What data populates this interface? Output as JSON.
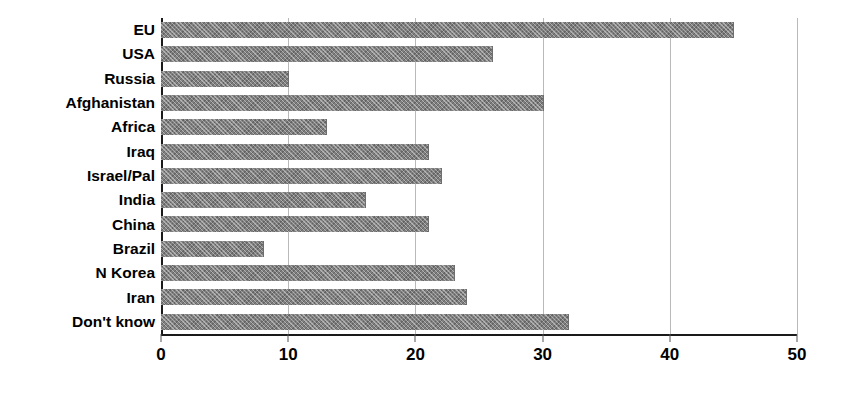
{
  "chart_data": {
    "type": "bar",
    "orientation": "horizontal",
    "title": "",
    "subtitle": "",
    "xlabel": "",
    "ylabel": "",
    "xlim": [
      0,
      50
    ],
    "ylim": null,
    "grid": true,
    "grid_axis": "x",
    "legend": false,
    "legend_position": "none",
    "categories": [
      "EU",
      "USA",
      "Russia",
      "Afghanistan",
      "Africa",
      "Iraq",
      "Israel/Pal",
      "India",
      "China",
      "Brazil",
      "N Korea",
      "Iran",
      "Don't know"
    ],
    "values": [
      45,
      26,
      10,
      30,
      13,
      21,
      22,
      16,
      21,
      8,
      23,
      24,
      32
    ],
    "xticks": [
      0,
      10,
      20,
      30,
      40,
      50
    ],
    "xticklabels": [
      "0",
      "10",
      "20",
      "30",
      "40",
      "50"
    ],
    "bar_color": "#7f7f7f",
    "bar_pattern": "crosshatch",
    "axis_color": "#1a1a1a",
    "grid_color": "#b9b9b9",
    "background_color": "#ffffff"
  }
}
